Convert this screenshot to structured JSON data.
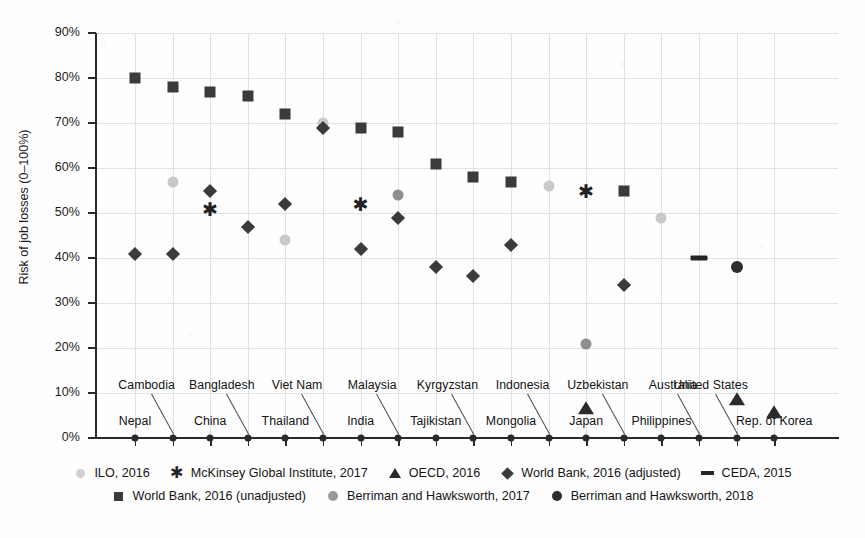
{
  "chart_data": {
    "type": "scatter",
    "title": "",
    "xlabel": "",
    "ylabel": "Risk of job losses (0–100%)",
    "ylim": [
      0,
      90
    ],
    "ytick_labels": [
      "90%",
      "80%",
      "70%",
      "60%",
      "50%",
      "40%",
      "30%",
      "20%",
      "10%",
      "0%"
    ],
    "ytick_values": [
      90,
      80,
      70,
      60,
      50,
      40,
      30,
      20,
      10,
      0
    ],
    "grid": true,
    "legend_position": "bottom",
    "categories": [
      "Nepal",
      "Cambodia",
      "China",
      "Bangladesh",
      "Thailand",
      "Viet Nam",
      "India",
      "Malaysia",
      "Tajikistan",
      "Kyrgyzstan",
      "Mongolia",
      "Indonesia",
      "Japan",
      "Uzbekistan",
      "Philippines",
      "Australia",
      "United States",
      "Rep. of Korea"
    ],
    "category_label_row": [
      "bottom",
      "top",
      "bottom",
      "top",
      "bottom",
      "top",
      "bottom",
      "top",
      "bottom",
      "top",
      "bottom",
      "top",
      "bottom",
      "top",
      "bottom",
      "top",
      "top",
      "bottom"
    ],
    "series": [
      {
        "name": "ILO, 2016",
        "marker": "circle-light",
        "color": "#c9c9c9",
        "points": [
          {
            "category": "Cambodia",
            "value": 57
          },
          {
            "category": "Thailand",
            "value": 44
          },
          {
            "category": "Viet Nam",
            "value": 70
          },
          {
            "category": "Indonesia",
            "value": 56
          },
          {
            "category": "Philippines",
            "value": 49
          }
        ]
      },
      {
        "name": "McKinsey Global Institute, 2017",
        "marker": "asterisk",
        "color": "#222222",
        "points": [
          {
            "category": "China",
            "value": 51
          },
          {
            "category": "India",
            "value": 52
          },
          {
            "category": "Japan",
            "value": 55
          }
        ]
      },
      {
        "name": "OECD, 2016",
        "marker": "triangle",
        "color": "#2b2b2b",
        "points": [
          {
            "category": "Japan",
            "value": 7
          },
          {
            "category": "United States",
            "value": 9
          },
          {
            "category": "Rep. of Korea",
            "value": 6
          }
        ]
      },
      {
        "name": "World Bank, 2016 (adjusted)",
        "marker": "diamond",
        "color": "#3b3b3b",
        "points": [
          {
            "category": "Nepal",
            "value": 41
          },
          {
            "category": "Cambodia",
            "value": 41
          },
          {
            "category": "China",
            "value": 55
          },
          {
            "category": "Bangladesh",
            "value": 47
          },
          {
            "category": "Thailand",
            "value": 52
          },
          {
            "category": "Viet Nam",
            "value": 69
          },
          {
            "category": "India",
            "value": 42
          },
          {
            "category": "Malaysia",
            "value": 49
          },
          {
            "category": "Tajikistan",
            "value": 38
          },
          {
            "category": "Kyrgyzstan",
            "value": 36
          },
          {
            "category": "Mongolia",
            "value": 43
          },
          {
            "category": "Uzbekistan",
            "value": 34
          }
        ]
      },
      {
        "name": "CEDA, 2015",
        "marker": "dash",
        "color": "#262626",
        "points": [
          {
            "category": "Australia",
            "value": 40
          }
        ]
      },
      {
        "name": "World Bank, 2016 (unadjusted)",
        "marker": "square",
        "color": "#3b3b3b",
        "points": [
          {
            "category": "Nepal",
            "value": 80
          },
          {
            "category": "Cambodia",
            "value": 78
          },
          {
            "category": "China",
            "value": 77
          },
          {
            "category": "Bangladesh",
            "value": 76
          },
          {
            "category": "Thailand",
            "value": 72
          },
          {
            "category": "India",
            "value": 69
          },
          {
            "category": "Malaysia",
            "value": 68
          },
          {
            "category": "Tajikistan",
            "value": 61
          },
          {
            "category": "Kyrgyzstan",
            "value": 58
          },
          {
            "category": "Mongolia",
            "value": 57
          },
          {
            "category": "Uzbekistan",
            "value": 55
          }
        ]
      },
      {
        "name": "Berriman and Hawksworth, 2017",
        "marker": "circle-mid",
        "color": "#8f8f8f",
        "points": [
          {
            "category": "Malaysia",
            "value": 54
          },
          {
            "category": "Japan",
            "value": 21
          }
        ]
      },
      {
        "name": "Berriman and Hawksworth, 2018",
        "marker": "circle-dark",
        "color": "#2e2e2e",
        "points": [
          {
            "category": "United States",
            "value": 38
          }
        ]
      }
    ],
    "legend_rows": [
      [
        "ILO, 2016",
        "McKinsey Global Institute, 2017",
        "OECD, 2016",
        "World Bank, 2016 (adjusted)",
        "CEDA, 2015"
      ],
      [
        "World Bank, 2016 (unadjusted)",
        "Berriman and Hawksworth, 2017",
        "Berriman and Hawksworth, 2018"
      ]
    ]
  },
  "legend": {
    "row1": [
      {
        "label": "ILO, 2016",
        "marker": "circle-light"
      },
      {
        "label": "McKinsey Global Institute, 2017",
        "marker": "asterisk"
      },
      {
        "label": "OECD, 2016",
        "marker": "triangle"
      },
      {
        "label": "World Bank, 2016 (adjusted)",
        "marker": "diamond"
      },
      {
        "label": "CEDA, 2015",
        "marker": "dash"
      }
    ],
    "row2": [
      {
        "label": "World Bank, 2016 (unadjusted)",
        "marker": "square"
      },
      {
        "label": "Berriman and Hawksworth, 2017",
        "marker": "circle-mid"
      },
      {
        "label": "Berriman and Hawksworth, 2018",
        "marker": "circle-dark"
      }
    ]
  }
}
